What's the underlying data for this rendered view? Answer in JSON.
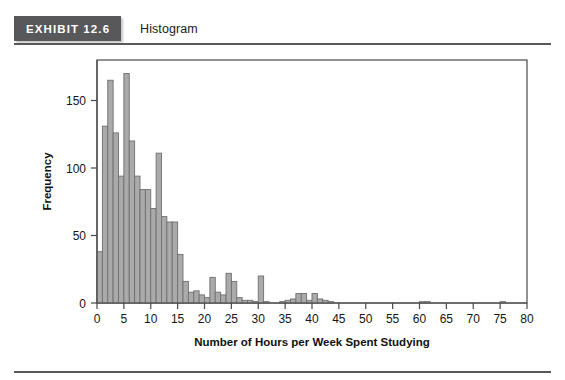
{
  "header": {
    "exhibit_tag": "EXHIBIT 12.6",
    "caption": "Histogram",
    "tag_bg_color": "#58585a",
    "rule_color": "#58585a"
  },
  "chart_data": {
    "type": "bar",
    "title": "Histogram",
    "xlabel": "Number of Hours per Week Spent Studying",
    "ylabel": "Frequency",
    "xlim": [
      0,
      80
    ],
    "ylim": [
      0,
      180
    ],
    "xticks": [
      0,
      5,
      10,
      15,
      20,
      25,
      30,
      35,
      40,
      45,
      50,
      55,
      60,
      65,
      70,
      75,
      80
    ],
    "yticks": [
      0,
      50,
      100,
      150
    ],
    "grid": false,
    "legend": null,
    "bar_fill_color": "#aaaaaa",
    "bar_stroke_color": "#6f6f6f",
    "bin_width": 1,
    "bins_start": [
      0,
      1,
      2,
      3,
      4,
      5,
      6,
      7,
      8,
      9,
      10,
      11,
      12,
      13,
      14,
      15,
      16,
      17,
      18,
      19,
      20,
      21,
      22,
      23,
      24,
      25,
      26,
      27,
      28,
      29,
      30,
      31,
      32,
      33,
      34,
      35,
      36,
      37,
      38,
      39,
      40,
      41,
      42,
      43,
      44,
      45,
      50,
      55,
      60,
      61,
      65,
      70,
      75
    ],
    "values": [
      38,
      131,
      165,
      126,
      94,
      170,
      120,
      94,
      84,
      84,
      70,
      111,
      64,
      60,
      60,
      36,
      16,
      8,
      9,
      6,
      4,
      19,
      8,
      6,
      22,
      16,
      4,
      2,
      2,
      1,
      20,
      1,
      0,
      0,
      1,
      2,
      3,
      7,
      7,
      2,
      7,
      3,
      2,
      1,
      0,
      0,
      0,
      0,
      1,
      1,
      0,
      0,
      1
    ]
  },
  "axes": {
    "y_axis_label": "Frequency",
    "x_axis_label": "Number of Hours per Week Spent Studying"
  }
}
